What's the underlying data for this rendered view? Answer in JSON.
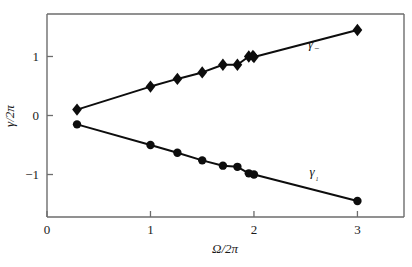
{
  "chart_data": {
    "type": "scatter",
    "title": "",
    "subtitle": "",
    "xlabel": "Ω/2π",
    "ylabel": "γ/2π",
    "xlim": [
      0,
      3.45
    ],
    "ylim": [
      -1.72,
      1.72
    ],
    "xticks": [
      0,
      1,
      2,
      3
    ],
    "xticklabels": [
      "0",
      "1",
      "2",
      "3"
    ],
    "yticks": [
      1,
      0,
      -1
    ],
    "yticklabels": [
      "1",
      "0",
      "−1"
    ],
    "grid": false,
    "legend_position": "inline-annotation",
    "annotations": [
      {
        "text": "γ−",
        "base": "γ",
        "sub": "−",
        "x": 2.58,
        "y": 1.15
      },
      {
        "text": "γ₁",
        "base": "γ",
        "sub": "₁",
        "x": 2.58,
        "y": -1.02
      }
    ],
    "series": [
      {
        "name": "γ−",
        "marker": "diamond",
        "label": "γ−",
        "color": "#0d0d0d",
        "x": [
          0.29,
          1.0,
          1.26,
          1.5,
          1.7,
          1.84,
          1.95,
          1.99,
          2.0,
          3.0
        ],
        "y": [
          0.1,
          0.49,
          0.62,
          0.73,
          0.86,
          0.86,
          1.0,
          1.01,
          0.99,
          1.45
        ]
      },
      {
        "name": "γ₁",
        "marker": "circle",
        "label": "γ₁",
        "color": "#0d0d0d",
        "x": [
          0.29,
          1.0,
          1.26,
          1.5,
          1.7,
          1.84,
          1.95,
          2.0,
          3.0
        ],
        "y": [
          -0.15,
          -0.5,
          -0.63,
          -0.76,
          -0.85,
          -0.87,
          -0.98,
          -1.0,
          -1.45
        ]
      }
    ]
  },
  "axes": {
    "x_axis_name": "omega-over-two-pi",
    "y_axis_name": "gamma-over-two-pi"
  }
}
